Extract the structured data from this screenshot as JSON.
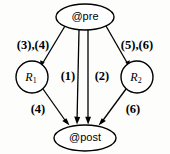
{
  "diagram": {
    "type": "directed-graph",
    "title": "",
    "background_color": "#fdfdfc",
    "stroke_color": "#000000",
    "nodes": [
      {
        "id": "pre",
        "label": "@pre",
        "shape": "ellipse",
        "cx": 85,
        "cy": 17,
        "rx": 29,
        "ry": 13
      },
      {
        "id": "r1",
        "label_base": "R",
        "label_sub": "1",
        "label_full": "R1",
        "shape": "circle",
        "cx": 32,
        "cy": 77,
        "r": 16
      },
      {
        "id": "r2",
        "label_base": "R",
        "label_sub": "2",
        "label_full": "R2",
        "shape": "circle",
        "cx": 137,
        "cy": 77,
        "r": 16
      },
      {
        "id": "post",
        "label": "@post",
        "shape": "ellipse",
        "cx": 85,
        "cy": 138,
        "rx": 31,
        "ry": 13
      }
    ],
    "edges": [
      {
        "id": "pre-r1",
        "from": "pre",
        "to": "r1",
        "label": "(3),(4)",
        "label_x": 33,
        "label_y": 46
      },
      {
        "id": "pre-post",
        "from": "pre",
        "to": "post",
        "label": "(1)",
        "label_x": 68,
        "label_y": 77
      },
      {
        "id": "pre-post-2",
        "from": "pre",
        "to": "post",
        "label": "(2)",
        "label_x": 102,
        "label_y": 77
      },
      {
        "id": "pre-r2",
        "from": "pre",
        "to": "r2",
        "label": "(5),(6)",
        "label_x": 137,
        "label_y": 46
      },
      {
        "id": "r1-post",
        "from": "r1",
        "to": "post",
        "label": "(4)",
        "label_x": 38,
        "label_y": 110
      },
      {
        "id": "r2-post",
        "from": "r2",
        "to": "post",
        "label": "(6)",
        "label_x": 133,
        "label_y": 110
      }
    ]
  }
}
